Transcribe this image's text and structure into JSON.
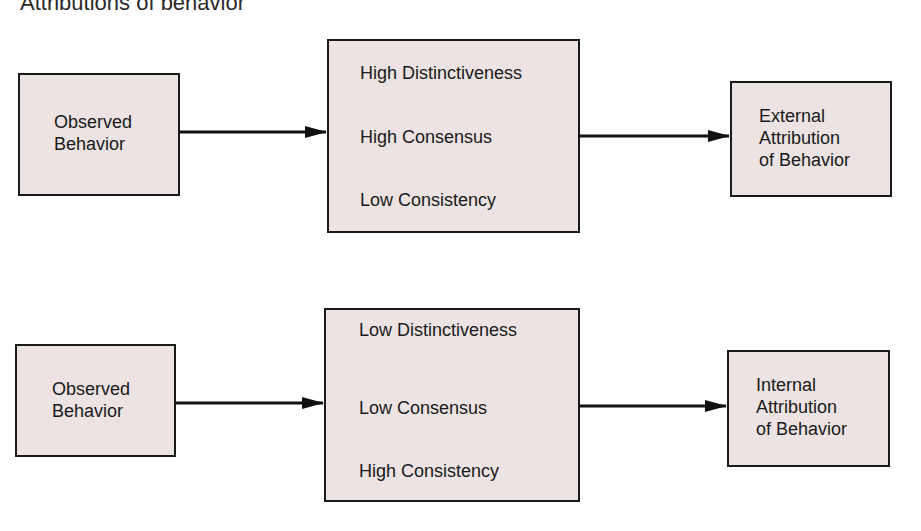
{
  "title": "Attributions of behavior",
  "colors": {
    "box_fill": "#ece3e2",
    "box_border": "#1a1a1a",
    "arrow": "#111111",
    "background": "#ffffff"
  },
  "rows": [
    {
      "input": {
        "line1": "Observed",
        "line2": "Behavior"
      },
      "factors": [
        "High Distinctiveness",
        "High Consensus",
        "Low Consistency"
      ],
      "output": {
        "line1": "External",
        "line2": "Attribution",
        "line3": "of Behavior"
      }
    },
    {
      "input": {
        "line1": "Observed",
        "line2": "Behavior"
      },
      "factors": [
        "Low Distinctiveness",
        "Low Consensus",
        "High Consistency"
      ],
      "output": {
        "line1": "Internal",
        "line2": "Attribution",
        "line3": "of Behavior"
      }
    }
  ]
}
